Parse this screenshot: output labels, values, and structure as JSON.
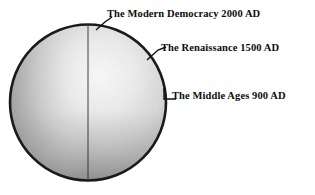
{
  "figure": {
    "type": "diagram",
    "background_color": "#ffffff",
    "shape": {
      "name": "circle",
      "outline_color": "#1a1a1a",
      "center_x": 88,
      "center_y": 102.5,
      "radius": 79,
      "divider": {
        "name": "vertical-divider-line",
        "x": 88,
        "color": "#2b2b2b"
      },
      "fill_description": "grayscale gradient, light upper-center, darker toward bottom and edges",
      "fill_light": "#f2f2f2",
      "fill_mid": "#c9c9c9",
      "fill_dark": "#8f8f8f"
    },
    "callouts": [
      {
        "id": "modern-democracy",
        "label": "The Modern Democracy 2000 AD",
        "era": "The Modern Democracy",
        "year": "2000 AD",
        "leader_style": "diagonal"
      },
      {
        "id": "renaissance",
        "label": "The Renaissance 1500 AD",
        "era": "The Renaissance",
        "year": "1500 AD",
        "leader_style": "diagonal"
      },
      {
        "id": "middle-ages",
        "label": "The Middle Ages 900 AD",
        "era": "The Middle Ages",
        "year": "900 AD",
        "leader_style": "horizontal-with-tick"
      }
    ]
  }
}
